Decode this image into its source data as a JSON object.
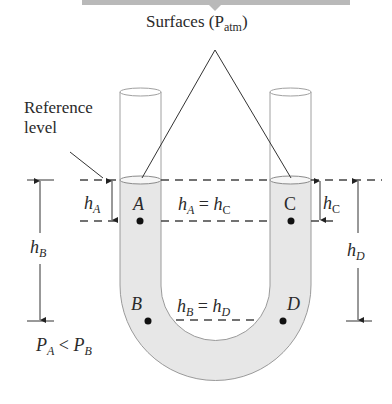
{
  "title": "Surfaces (P",
  "title_sub": "atm",
  "title_close": ")",
  "reference_label": [
    "Reference",
    "level"
  ],
  "points": {
    "A": "A",
    "B": "B",
    "C": "C",
    "D": "D"
  },
  "heights": {
    "hA": {
      "h": "h",
      "sub": "A"
    },
    "hB": {
      "h": "h",
      "sub": "B"
    },
    "hC": {
      "h": "h",
      "sub": "C"
    },
    "hD": {
      "h": "h",
      "sub": "D"
    }
  },
  "equations": {
    "eq_top": {
      "l": "h",
      "ls": "A",
      "op": " = ",
      "r": "h",
      "rs": "C"
    },
    "eq_bottom": {
      "l": "h",
      "ls": "B",
      "op": " = ",
      "r": "h",
      "rs": "D"
    },
    "pressure": {
      "l": "P",
      "ls": "A",
      "op": " < ",
      "r": "P",
      "rs": "B"
    }
  },
  "colors": {
    "fluid": "#e6e6e6",
    "line": "#333333",
    "tube_outline": "#9a9a9a",
    "top_bar": "#b9b9b9"
  }
}
